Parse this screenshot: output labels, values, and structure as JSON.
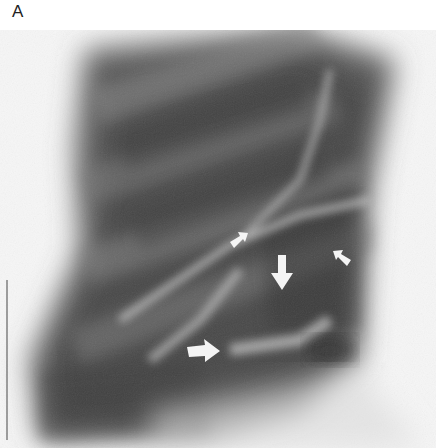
{
  "figure": {
    "panel_label": "A",
    "arrows": [
      {
        "id": "small-arrow-upper-left",
        "type": "arrowhead",
        "direction": "up-right",
        "x": 238,
        "y": 240
      },
      {
        "id": "small-arrow-upper-right",
        "type": "arrowhead",
        "direction": "up-left",
        "x": 341,
        "y": 258
      },
      {
        "id": "large-arrow-down",
        "type": "arrow",
        "direction": "down",
        "x": 282,
        "y": 280
      },
      {
        "id": "large-arrow-right",
        "type": "arrow",
        "direction": "right",
        "x": 202,
        "y": 352
      }
    ]
  }
}
